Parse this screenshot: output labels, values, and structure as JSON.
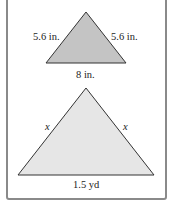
{
  "figure": {
    "small_triangle": {
      "left_side": "5.6 in.",
      "right_side": "5.6 in.",
      "base": "8 in.",
      "fill": "#c4c4c4"
    },
    "large_triangle": {
      "left_side": "x",
      "right_side": "x",
      "base": "1.5 yd",
      "fill": "#e6e6e6"
    },
    "border_color": "#8a8a8a",
    "stroke_color": "#333333"
  }
}
